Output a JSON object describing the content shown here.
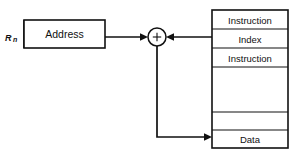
{
  "diagram": {
    "register": {
      "label_main": "R",
      "label_sub": "n",
      "name": "register-rn"
    },
    "address_box": {
      "label": "Address"
    },
    "adder": {
      "symbol": "+",
      "name": "adder-node"
    },
    "memory_table": {
      "rows": [
        {
          "label": "Instruction",
          "empty": false
        },
        {
          "label": "Index",
          "empty": false
        },
        {
          "label": "Instruction",
          "empty": false
        },
        {
          "label": "",
          "empty": true
        },
        {
          "label": "",
          "empty": true
        },
        {
          "label": "Data",
          "empty": false
        }
      ]
    },
    "connections": [
      {
        "name": "address-to-adder",
        "from": "address_box",
        "to": "adder",
        "direction": "right"
      },
      {
        "name": "index-to-adder",
        "from": "memory_table.row.1",
        "to": "adder",
        "direction": "left"
      },
      {
        "name": "adder-to-data",
        "from": "adder",
        "to": "memory_table.row.5",
        "direction": "down-right"
      }
    ],
    "colors": {
      "stroke": "#111111",
      "background": "#ffffff",
      "text": "#111111"
    }
  }
}
